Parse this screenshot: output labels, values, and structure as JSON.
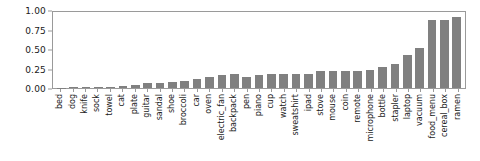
{
  "chart_data": {
    "type": "bar",
    "title": "",
    "xlabel": "",
    "ylabel": "",
    "ylim": [
      0.0,
      1.0
    ],
    "xlim_padding": "category",
    "grid": false,
    "legend": null,
    "bar_color": "#808080",
    "axes_color": "#9a9a9a",
    "ytick_labels": [
      "0.00",
      "0.25",
      "0.50",
      "0.75",
      "1.00"
    ],
    "ytick_values": [
      0.0,
      0.25,
      0.5,
      0.75,
      1.0
    ],
    "categories": [
      "bed",
      "dog",
      "knife",
      "sock",
      "towel",
      "cat",
      "plate",
      "guitar",
      "sandal",
      "shoe",
      "broccoli",
      "car",
      "oven",
      "electric_fan",
      "backpack",
      "pen",
      "piano",
      "cup",
      "watch",
      "sweatshirt",
      "ipad",
      "stove",
      "mouse",
      "coin",
      "remote",
      "microphone",
      "bottle",
      "stapler",
      "laptop",
      "vacuum",
      "food_menu",
      "cereal_box",
      "ramen"
    ],
    "values": [
      0.005,
      0.008,
      0.01,
      0.012,
      0.015,
      0.02,
      0.04,
      0.06,
      0.06,
      0.08,
      0.09,
      0.12,
      0.15,
      0.17,
      0.18,
      0.15,
      0.17,
      0.18,
      0.18,
      0.18,
      0.19,
      0.23,
      0.22,
      0.22,
      0.23,
      0.24,
      0.28,
      0.31,
      0.44,
      0.52,
      0.9,
      0.9,
      0.93
    ]
  }
}
